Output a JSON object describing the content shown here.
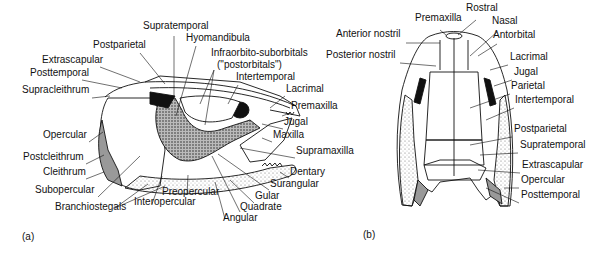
{
  "figure": {
    "panel_a": {
      "tag": "(a)",
      "labels": [
        {
          "text": "Supratemporal",
          "x": 143,
          "y": 29
        },
        {
          "text": "Hyomandibula",
          "x": 186,
          "y": 41
        },
        {
          "text": "Postparietal",
          "x": 93,
          "y": 48
        },
        {
          "text": "Infraorbito-suborbitals",
          "x": 211,
          "y": 56
        },
        {
          "text": "(\"postorbitals\")",
          "x": 217,
          "y": 68
        },
        {
          "text": "Extrascapular",
          "x": 42,
          "y": 63
        },
        {
          "text": "Posttemporal",
          "x": 30,
          "y": 76
        },
        {
          "text": "Intertemporal",
          "x": 236,
          "y": 80
        },
        {
          "text": "Supracleithrum",
          "x": 22,
          "y": 93
        },
        {
          "text": "Lacrimal",
          "x": 286,
          "y": 92
        },
        {
          "text": "Premaxilla",
          "x": 291,
          "y": 109
        },
        {
          "text": "Jugal",
          "x": 284,
          "y": 125
        },
        {
          "text": "Opercular",
          "x": 43,
          "y": 138
        },
        {
          "text": "Maxilla",
          "x": 273,
          "y": 138
        },
        {
          "text": "Supramaxilla",
          "x": 296,
          "y": 154
        },
        {
          "text": "Postcleithrum",
          "x": 23,
          "y": 160
        },
        {
          "text": "Cleithrum",
          "x": 43,
          "y": 175
        },
        {
          "text": "Dentary",
          "x": 290,
          "y": 175
        },
        {
          "text": "Surangular",
          "x": 270,
          "y": 187
        },
        {
          "text": "Subopercular",
          "x": 35,
          "y": 193
        },
        {
          "text": "Preopercular",
          "x": 162,
          "y": 195
        },
        {
          "text": "Gular",
          "x": 255,
          "y": 199
        },
        {
          "text": "Branchiostegals",
          "x": 55,
          "y": 210
        },
        {
          "text": "Interopercular",
          "x": 134,
          "y": 205
        },
        {
          "text": "Quadrate",
          "x": 240,
          "y": 210
        },
        {
          "text": "Angular",
          "x": 223,
          "y": 221
        }
      ]
    },
    "panel_b": {
      "tag": "(b)",
      "labels": [
        {
          "text": "Rostral",
          "x": 466,
          "y": 11
        },
        {
          "text": "Premaxilla",
          "x": 415,
          "y": 21
        },
        {
          "text": "Nasal",
          "x": 492,
          "y": 24
        },
        {
          "text": "Anterior nostril",
          "x": 336,
          "y": 37
        },
        {
          "text": "Antorbital",
          "x": 493,
          "y": 38
        },
        {
          "text": "Posterior nostril",
          "x": 326,
          "y": 58
        },
        {
          "text": "Lacrimal",
          "x": 510,
          "y": 60
        },
        {
          "text": "Jugal",
          "x": 514,
          "y": 75
        },
        {
          "text": "Parietal",
          "x": 511,
          "y": 89
        },
        {
          "text": "Intertemporal",
          "x": 515,
          "y": 103
        },
        {
          "text": "Postparietal",
          "x": 514,
          "y": 132
        },
        {
          "text": "Supratemporal",
          "x": 520,
          "y": 148
        },
        {
          "text": "Extrascapular",
          "x": 522,
          "y": 168
        },
        {
          "text": "Opercular",
          "x": 521,
          "y": 183
        },
        {
          "text": "Posttemporal",
          "x": 521,
          "y": 198
        }
      ]
    }
  }
}
